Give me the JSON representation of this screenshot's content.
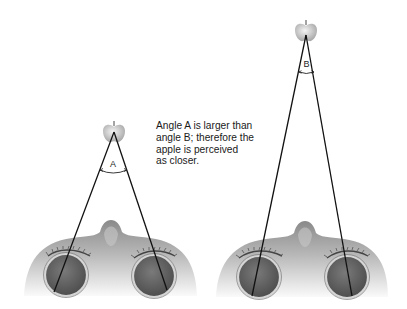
{
  "figure": {
    "caption_lines": [
      "Angle A is larger than",
      "angle B; therefore the",
      "apple is perceived",
      "as closer."
    ],
    "left_scene": {
      "angle_label": "A",
      "apple": {
        "cx": 114,
        "cy": 134
      },
      "apex": {
        "x": 114,
        "y": 132
      },
      "line_ends": [
        {
          "x": 54,
          "y": 292
        },
        {
          "x": 167,
          "y": 290
        }
      ],
      "eyes": [
        {
          "cx": 66,
          "cy": 275,
          "r": 21
        },
        {
          "cx": 154,
          "cy": 276,
          "r": 21
        }
      ],
      "arc_y": 172
    },
    "right_scene": {
      "angle_label": "B",
      "apple": {
        "cx": 306,
        "cy": 33
      },
      "apex": {
        "x": 306,
        "y": 35
      },
      "line_ends": [
        {
          "x": 252,
          "y": 296
        },
        {
          "x": 352,
          "y": 296
        }
      ],
      "eyes": [
        {
          "cx": 259,
          "cy": 277,
          "r": 21
        },
        {
          "cx": 347,
          "cy": 277,
          "r": 21
        }
      ],
      "arc_y": 72
    },
    "colors": {
      "line": "#111111",
      "skin_dark": "#8e8e8e",
      "skin_light": "#f2f2f2",
      "eye": "#6a6a6a",
      "eye_ring": "#c9c9c9",
      "apple": "#d6d6d6"
    }
  }
}
